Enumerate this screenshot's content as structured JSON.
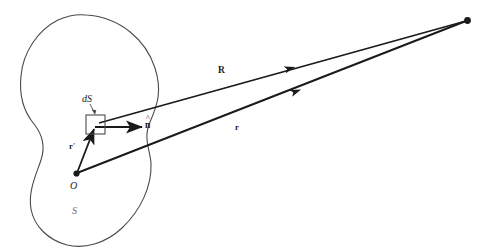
{
  "figure": {
    "name": "surface-integral-vector-diagram",
    "background_color": "#ffffff",
    "stroke_color": "#1a1a1a",
    "outline_color": "#4a4a4a",
    "width": 489,
    "height": 252
  },
  "labels": {
    "surface_element": "dS",
    "normal_vector": "n",
    "normal_hat": "^",
    "origin": "O",
    "surface": "S",
    "source_vector": "r",
    "source_vector_prime": "′",
    "separation_vector": "R",
    "field_vector": "r"
  },
  "geometry": {
    "origin_point": {
      "x": 76,
      "y": 174
    },
    "field_point": {
      "x": 468,
      "y": 20
    },
    "surface_element_square": {
      "x": 86,
      "y": 115,
      "width": 19,
      "height": 19
    },
    "normal_arrow_tip": {
      "x": 143,
      "y": 127
    },
    "separation_arrow_head": {
      "x": 283,
      "y": 70
    },
    "field_arrow_head": {
      "x": 288,
      "y": 95
    }
  }
}
